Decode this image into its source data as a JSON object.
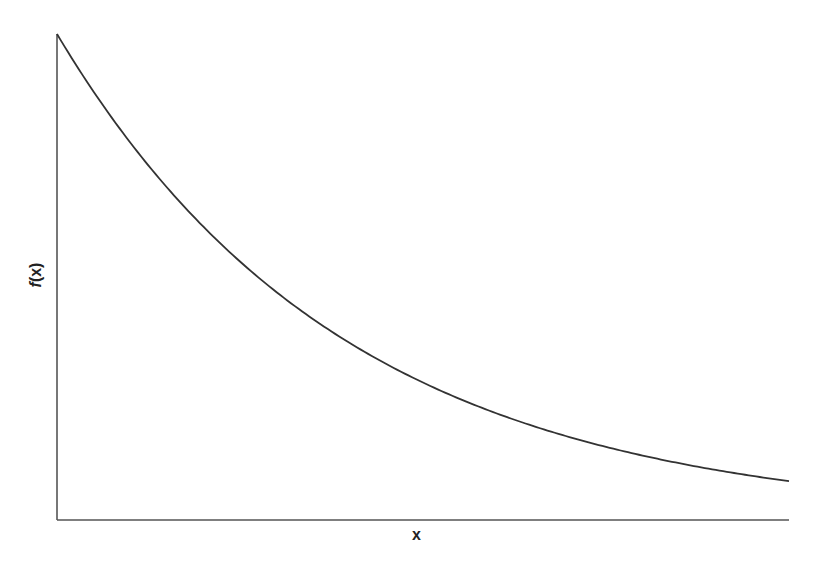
{
  "chart_data": {
    "type": "line",
    "title": "",
    "xlabel": "x",
    "ylabel": "f(x)",
    "grid": false,
    "legend": null,
    "ticks": "none",
    "x": [
      0,
      0.1,
      0.2,
      0.3,
      0.4,
      0.5,
      0.6,
      0.7,
      0.8,
      0.9,
      1.0
    ],
    "series": [
      {
        "name": "f(x)",
        "values": [
          1.0,
          0.777,
          0.603,
          0.468,
          0.364,
          0.283,
          0.219,
          0.17,
          0.132,
          0.103,
          0.08
        ]
      }
    ],
    "xlim": [
      0,
      1
    ],
    "ylim": [
      0,
      1
    ]
  },
  "axes": {
    "x_label": "x",
    "y_label_fn": "f",
    "y_label_arg": "(x)"
  },
  "colors": {
    "curve": "#333333",
    "axis": "#555555",
    "background": "#ffffff"
  }
}
